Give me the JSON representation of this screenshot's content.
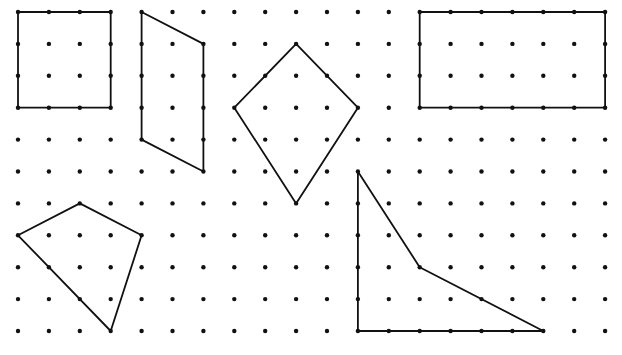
{
  "diagram": {
    "type": "dot-grid-geometry",
    "background": "#ffffff",
    "stroke_color": "#111111",
    "dot_color": "#111111",
    "grid": {
      "columns": 20,
      "rows": 11,
      "origin_x": 18,
      "origin_y": 12,
      "step_x": 30.9,
      "step_y": 31.9,
      "dot_radius": 2.2
    },
    "shapes": [
      {
        "name": "square",
        "kind": "square",
        "points_grid": [
          [
            0,
            0
          ],
          [
            3,
            0
          ],
          [
            3,
            3
          ],
          [
            0,
            3
          ]
        ]
      },
      {
        "name": "parallelogram",
        "kind": "parallelogram",
        "points_grid": [
          [
            4,
            0
          ],
          [
            6,
            1
          ],
          [
            6,
            5
          ],
          [
            4,
            4
          ]
        ]
      },
      {
        "name": "kite",
        "kind": "kite",
        "points_grid": [
          [
            9,
            1
          ],
          [
            11,
            3
          ],
          [
            9,
            6
          ],
          [
            7,
            3
          ]
        ]
      },
      {
        "name": "rectangle",
        "kind": "rectangle",
        "points_grid": [
          [
            13,
            0
          ],
          [
            19,
            0
          ],
          [
            19,
            3
          ],
          [
            13,
            3
          ]
        ]
      },
      {
        "name": "irregular-quadrilateral",
        "kind": "quadrilateral",
        "points_grid": [
          [
            0,
            7
          ],
          [
            2,
            6
          ],
          [
            4,
            7
          ],
          [
            3,
            10
          ]
        ]
      },
      {
        "name": "concave-quadrilateral",
        "kind": "concave-quadrilateral",
        "points_grid": [
          [
            11,
            5
          ],
          [
            13,
            8
          ],
          [
            17,
            10
          ],
          [
            11,
            10
          ]
        ]
      }
    ]
  }
}
